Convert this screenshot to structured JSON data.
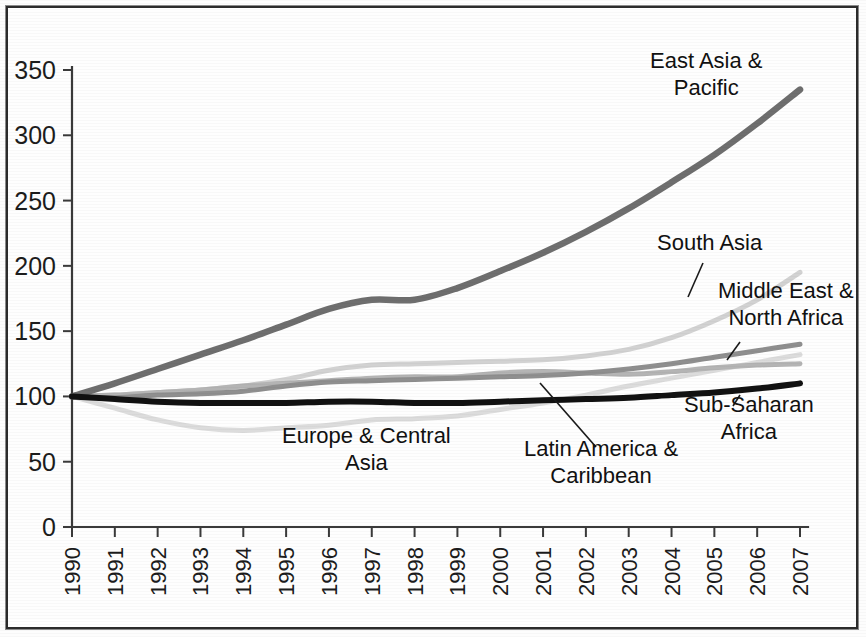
{
  "chart_data": {
    "type": "line",
    "title": "",
    "subtitle": "",
    "xlabel": "",
    "ylabel": "",
    "xlim": [
      1990,
      2007
    ],
    "ylim": [
      0,
      350
    ],
    "ytick_step": 50,
    "yticks": [
      "0",
      "50",
      "100",
      "150",
      "200",
      "250",
      "300",
      "350"
    ],
    "grid": false,
    "legend_position": "inline-annotations",
    "x": [
      "1990",
      "1991",
      "1992",
      "1993",
      "1994",
      "1995",
      "1996",
      "1997",
      "1998",
      "1999",
      "2000",
      "2001",
      "2002",
      "2003",
      "2004",
      "2005",
      "2006",
      "2007"
    ],
    "series": [
      {
        "name": "East Asia & Pacific",
        "color": "#6e6e6e",
        "width": 6.5,
        "values": [
          100,
          110,
          121,
          132,
          143,
          155,
          167,
          174,
          174,
          183,
          196,
          210,
          226,
          244,
          264,
          285,
          309,
          335
        ]
      },
      {
        "name": "South Asia",
        "color": "#d2d2d2",
        "width": 5.0,
        "values": [
          100,
          101,
          103,
          105,
          108,
          113,
          120,
          124,
          125,
          126,
          127,
          128,
          131,
          136,
          145,
          158,
          174,
          195
        ]
      },
      {
        "name": "Middle East & North Africa",
        "color": "#8f8f8f",
        "width": 5.0,
        "values": [
          100,
          99,
          101,
          102,
          104,
          108,
          111,
          112,
          113,
          114,
          115,
          116,
          118,
          121,
          125,
          130,
          135,
          140
        ]
      },
      {
        "name": "Latin America & Caribbean",
        "color": "#b4b4b4",
        "width": 5.0,
        "values": [
          100,
          101,
          103,
          105,
          108,
          110,
          112,
          114,
          115,
          115,
          118,
          119,
          118,
          117,
          119,
          122,
          124,
          125
        ]
      },
      {
        "name": "Europe & Central Asia",
        "color": "#dcdcdc",
        "width": 5.0,
        "values": [
          100,
          91,
          82,
          76,
          74,
          76,
          78,
          82,
          83,
          85,
          90,
          95,
          101,
          108,
          114,
          120,
          126,
          132
        ]
      },
      {
        "name": "Sub-Saharan Africa",
        "color": "#111111",
        "width": 6.0,
        "values": [
          100,
          98,
          96,
          95,
          95,
          95,
          96,
          96,
          95,
          95,
          96,
          97,
          98,
          99,
          101,
          103,
          106,
          110
        ]
      }
    ],
    "annotations": [
      {
        "name": "east-asia-pacific",
        "lines": [
          "East Asia &",
          "Pacific"
        ],
        "x": 650,
        "y": 68,
        "align": "start",
        "leader": null
      },
      {
        "name": "south-asia",
        "lines": [
          "South Asia"
        ],
        "x": 657,
        "y": 250,
        "align": "start",
        "leader": {
          "x1": 703,
          "y1": 263,
          "x2": 688,
          "y2": 297
        }
      },
      {
        "name": "middle-east-north-africa",
        "lines": [
          "Middle East &",
          "North Africa"
        ],
        "x": 718,
        "y": 298,
        "align": "start",
        "leader": {
          "x1": 740,
          "y1": 342,
          "x2": 727,
          "y2": 360
        }
      },
      {
        "name": "europe-central-asia",
        "lines": [
          "Europe & Central",
          "Asia"
        ],
        "x": 282,
        "y": 443,
        "align": "start",
        "leader": null
      },
      {
        "name": "latin-america-caribbean",
        "lines": [
          "Latin America &",
          "Caribbean"
        ],
        "x": 524,
        "y": 456,
        "align": "start",
        "leader": {
          "x1": 540,
          "y1": 383,
          "x2": 596,
          "y2": 447
        }
      },
      {
        "name": "sub-saharan-africa",
        "lines": [
          "Sub-Saharan",
          "Africa"
        ],
        "x": 684,
        "y": 412,
        "align": "start",
        "leader": {
          "x1": 740,
          "y1": 395,
          "x2": 733,
          "y2": 406
        }
      }
    ]
  },
  "axes": {
    "y_axis_name": "index-axis",
    "x_axis_name": "year-axis"
  }
}
